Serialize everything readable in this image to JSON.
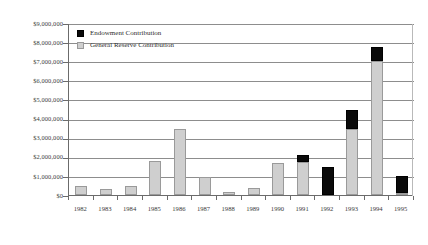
{
  "chart_data": {
    "type": "bar",
    "subtype": "stacked-vertical",
    "title": "",
    "xlabel": "",
    "ylabel": "",
    "categories": [
      "1982",
      "1983",
      "1984",
      "1985",
      "1986",
      "1987",
      "1988",
      "1989",
      "1990",
      "1991",
      "1992",
      "1993",
      "1994",
      "1995"
    ],
    "series": [
      {
        "name": "General Reserve Contribution",
        "color": "#cfcfcf",
        "values": [
          450000,
          300000,
          450000,
          1800000,
          3450000,
          950000,
          150000,
          350000,
          1700000,
          1750000,
          0,
          3450000,
          7000000,
          100000
        ]
      },
      {
        "name": "Endowment Contribution",
        "color": "#0a0a0a",
        "values": [
          0,
          0,
          0,
          0,
          0,
          0,
          0,
          0,
          0,
          350000,
          1450000,
          1000000,
          750000,
          900000
        ]
      }
    ],
    "totals": [
      450000,
      300000,
      450000,
      1800000,
      3450000,
      950000,
      150000,
      350000,
      1700000,
      2100000,
      1450000,
      4450000,
      7750000,
      1000000
    ],
    "ylim": [
      0,
      9000000
    ],
    "ytick_step": 1000000,
    "ytick_labels": [
      "$0",
      "$1,000,000",
      "$2,000,000",
      "$3,000,000",
      "$4,000,000",
      "$5,000,000",
      "$6,000,000",
      "$7,000,000",
      "$8,000,000",
      "$9,000,000"
    ],
    "ytick_values": [
      0,
      1000000,
      2000000,
      3000000,
      4000000,
      5000000,
      6000000,
      7000000,
      8000000,
      9000000
    ],
    "grid": true,
    "grid_axis": "y",
    "legend_position": "top-left",
    "legend": [
      {
        "label": "Endowment Contribution",
        "swatch": "endowment"
      },
      {
        "label": "General Reserve Contribution",
        "swatch": "reserve"
      }
    ],
    "stack_order": [
      "General Reserve Contribution",
      "Endowment Contribution"
    ]
  },
  "axis_colors": {
    "gridline": "#8d8d8d",
    "axis": "#6b6b6b",
    "text": "#3b3b3b"
  }
}
